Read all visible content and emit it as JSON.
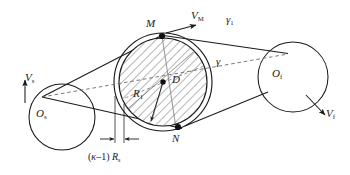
{
  "figure": {
    "kind": "belt-drive-kinematics-diagram",
    "background": "#ffffff",
    "line_color": "#1a1a1a",
    "hatch_color": "#555555",
    "dash_color": "#6b6b6b"
  },
  "labels": {
    "left_pulley": {
      "base": "O",
      "sub": "s"
    },
    "right_pulley": {
      "base": "O",
      "sub": "f"
    },
    "center_point": {
      "base": "D",
      "sub": ""
    },
    "radius": {
      "base": "R",
      "sub": "1"
    },
    "point_m": {
      "base": "M",
      "sub": ""
    },
    "point_n": {
      "base": "N",
      "sub": ""
    },
    "velocity_left": {
      "base": "V",
      "sub": "s"
    },
    "velocity_right": {
      "base": "V",
      "sub": "f"
    },
    "velocity_m": {
      "base": "V",
      "sub": "M"
    },
    "angle_gamma": {
      "base": "γ",
      "sub": ""
    },
    "angle_gamma1": {
      "base": "γ",
      "sub": "1"
    },
    "dimension": {
      "open_paren": "(",
      "kappa": "κ",
      "minus_one": "–1",
      "close_paren": ")",
      "base": "R",
      "sub": "s"
    }
  },
  "geometry": {
    "left_pulley": {
      "cx": 62,
      "cy": 117,
      "r": 33
    },
    "right_pulley": {
      "cx": 293,
      "cy": 77,
      "r": 35
    },
    "center_disc": {
      "cx": 163,
      "cy": 82,
      "r_inner": 44,
      "r_outer": 49
    },
    "point_m": {
      "x": 162,
      "y": 36
    },
    "point_n": {
      "x": 178,
      "y": 127
    },
    "tangent_junction": {
      "x": 42,
      "y": 97
    },
    "dimension_line_y": 139,
    "dimension_ticks": [
      115,
      124
    ]
  }
}
